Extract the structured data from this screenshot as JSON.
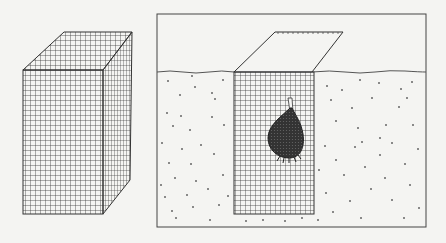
{
  "figure": {
    "left_panel": {
      "subject": "wire-mesh-cage",
      "description": "Open-top rectangular wire mesh basket"
    },
    "right_panel": {
      "subject": "bulb-planted-in-mesh-cage",
      "description": "Mesh cage buried in soil with a bulb inside and a mesh lid hinged open above the ground line"
    }
  },
  "colors": {
    "background": "#f4f4f2",
    "line": "#333333",
    "bulb": "#3a3a3a"
  }
}
